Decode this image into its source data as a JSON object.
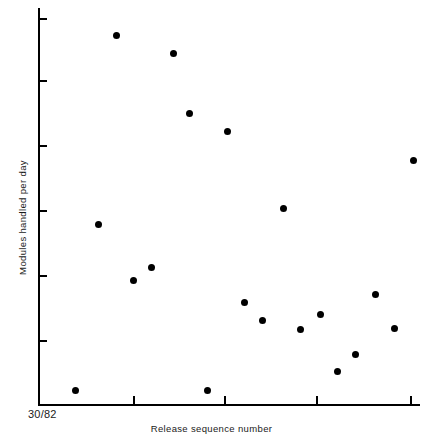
{
  "figure": {
    "background_color": "#ffffff",
    "ink_color": "#000000",
    "origin_label": "30/82",
    "x_axis_label": "Release sequence number",
    "y_axis_label": "Modules handled per day"
  },
  "chart_data": {
    "type": "scatter",
    "title": "",
    "xlabel": "Release sequence number",
    "ylabel": "Modules handled per day",
    "origin_tick_label": "30/82",
    "grid": false,
    "legend": false,
    "marker": "filled-circle",
    "marker_color": "#000000",
    "marker_size_px": 7,
    "xlim": [
      0,
      20
    ],
    "ylim": [
      0,
      12
    ],
    "x_tick_values": [
      5,
      10,
      15,
      19
    ],
    "y_tick_values": [
      2,
      4,
      6,
      8,
      10,
      12
    ],
    "x_tick_labels": [
      "",
      "",
      "",
      ""
    ],
    "y_tick_labels": [
      "",
      "",
      "",
      "",
      "",
      ""
    ],
    "x": [
      1.9,
      4.1,
      7.1,
      8.0,
      9.9,
      10.9,
      3.1,
      5.9,
      5.0,
      12.8,
      10.8,
      11.7,
      14.7,
      13.7,
      17.6,
      18.6,
      16.6,
      15.6,
      8.8
    ],
    "y": [
      11.4,
      10.9,
      10.2,
      9.6,
      9.0,
      8.6,
      7.2,
      5.9,
      5.5,
      5.1,
      4.6,
      4.3,
      4.4,
      4.0,
      4.8,
      4.0,
      3.2,
      2.7,
      0.6
    ],
    "points": [
      {
        "px": 116,
        "py": 35,
        "x": 4.1,
        "y": 11.4
      },
      {
        "px": 173,
        "py": 53,
        "x": 7.1,
        "y": 10.9
      },
      {
        "px": 189,
        "py": 113,
        "x": 8.0,
        "y": 9.0
      },
      {
        "px": 227,
        "py": 131,
        "x": 9.9,
        "y": 8.5
      },
      {
        "px": 413,
        "py": 160,
        "x": 19.6,
        "y": 7.6
      },
      {
        "px": 283,
        "py": 208,
        "x": 12.8,
        "y": 6.2
      },
      {
        "px": 98,
        "py": 224,
        "x": 3.1,
        "y": 5.7
      },
      {
        "px": 151,
        "py": 267,
        "x": 5.9,
        "y": 4.4
      },
      {
        "px": 133,
        "py": 280,
        "x": 5.0,
        "y": 4.0
      },
      {
        "px": 244,
        "py": 302,
        "x": 10.8,
        "y": 3.3
      },
      {
        "px": 262,
        "py": 320,
        "x": 11.7,
        "y": 2.8
      },
      {
        "px": 320,
        "py": 314,
        "x": 14.7,
        "y": 3.0
      },
      {
        "px": 300,
        "py": 329,
        "x": 13.7,
        "y": 2.5
      },
      {
        "px": 375,
        "py": 294,
        "x": 17.6,
        "y": 3.6
      },
      {
        "px": 394,
        "py": 328,
        "x": 18.6,
        "y": 2.5
      },
      {
        "px": 355,
        "py": 354,
        "x": 16.6,
        "y": 1.7
      },
      {
        "px": 337,
        "py": 371,
        "x": 15.6,
        "y": 1.2
      },
      {
        "px": 75,
        "py": 390,
        "x": 1.9,
        "y": 0.6
      },
      {
        "px": 207,
        "py": 390,
        "x": 8.8,
        "y": 0.6
      }
    ],
    "axis_geometry": {
      "plot_left_px": 38,
      "plot_right_px": 420,
      "plot_top_px": 8,
      "plot_bottom_px": 404,
      "y_tick_px": [
        18,
        80,
        145,
        210,
        275,
        340
      ],
      "x_tick_px": [
        133,
        224,
        316,
        410
      ]
    }
  }
}
